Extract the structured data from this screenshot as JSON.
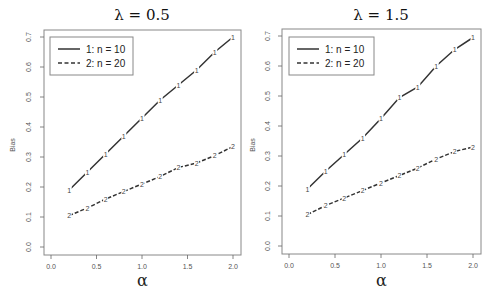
{
  "chart_data": [
    {
      "type": "line",
      "title": "λ = 0.5",
      "xlabel": "α",
      "ylabel": "Bias",
      "xlim": [
        0.0,
        2.0
      ],
      "ylim": [
        0.0,
        0.7
      ],
      "xticks": [
        "0.0",
        "0.5",
        "1.0",
        "1.5",
        "2.0"
      ],
      "yticks": [
        "0.0",
        "0.1",
        "0.2",
        "0.3",
        "0.4",
        "0.5",
        "0.6",
        "0.7"
      ],
      "grid": false,
      "legend_position": "top-left",
      "x": [
        0.2,
        0.4,
        0.6,
        0.8,
        1.0,
        1.2,
        1.4,
        1.6,
        1.8,
        2.0
      ],
      "series": [
        {
          "name": "1: n = 10",
          "marker": "1",
          "linestyle": "solid",
          "values": [
            0.19,
            0.25,
            0.31,
            0.37,
            0.43,
            0.49,
            0.54,
            0.59,
            0.65,
            0.7
          ]
        },
        {
          "name": "2: n = 20",
          "marker": "2",
          "linestyle": "dashed",
          "values": [
            0.105,
            0.13,
            0.16,
            0.185,
            0.21,
            0.235,
            0.265,
            0.28,
            0.305,
            0.335
          ]
        }
      ]
    },
    {
      "type": "line",
      "title": "λ = 1.5",
      "xlabel": "α",
      "ylabel": "Bias",
      "xlim": [
        0.0,
        2.0
      ],
      "ylim": [
        0.0,
        0.7
      ],
      "xticks": [
        "0.0",
        "0.5",
        "1.0",
        "1.5",
        "2.0"
      ],
      "yticks": [
        "0.0",
        "0.1",
        "0.2",
        "0.3",
        "0.4",
        "0.5",
        "0.6",
        "0.7"
      ],
      "grid": false,
      "legend_position": "top-left",
      "x": [
        0.2,
        0.4,
        0.6,
        0.8,
        1.0,
        1.2,
        1.4,
        1.6,
        1.8,
        2.0
      ],
      "series": [
        {
          "name": "1: n = 10",
          "marker": "1",
          "linestyle": "solid",
          "values": [
            0.19,
            0.25,
            0.305,
            0.36,
            0.425,
            0.495,
            0.53,
            0.6,
            0.655,
            0.695
          ]
        },
        {
          "name": "2: n = 20",
          "marker": "2",
          "linestyle": "dashed",
          "values": [
            0.105,
            0.135,
            0.16,
            0.185,
            0.21,
            0.235,
            0.26,
            0.29,
            0.315,
            0.33
          ]
        }
      ]
    }
  ],
  "colors": {
    "line": "#333333",
    "axis": "#666666",
    "box": "#888888"
  }
}
